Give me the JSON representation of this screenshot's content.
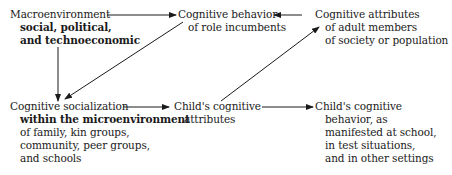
{
  "diagram": {
    "nodes": {
      "macro": {
        "lines": [
          "Macroenvironment",
          "social, political,",
          "and technoeconomic"
        ]
      },
      "role": {
        "lines": [
          "Cognitive behavior",
          "of role incumbents"
        ]
      },
      "adult": {
        "lines": [
          "Cognitive attributes",
          "of adult members",
          "of society or population"
        ]
      },
      "social": {
        "lines": [
          "Cognitive socialization",
          "within the microenvironment",
          "of family, kin groups,",
          "community, peer groups,",
          "and schools"
        ]
      },
      "childattr": {
        "lines": [
          "Child's cognitive",
          "attributes"
        ]
      },
      "childbeh": {
        "lines": [
          "Child's cognitive",
          "behavior, as",
          "manifested at school,",
          "in test situations,",
          "and in other settings"
        ]
      }
    },
    "edges": [
      {
        "from": "macro",
        "to": "role"
      },
      {
        "from": "adult",
        "to": "role"
      },
      {
        "from": "macro",
        "to": "social"
      },
      {
        "from": "role",
        "to": "social"
      },
      {
        "from": "social",
        "to": "childattr"
      },
      {
        "from": "childattr",
        "to": "adult"
      },
      {
        "from": "childattr",
        "to": "childbeh"
      }
    ],
    "colors": {
      "ink": "#1a1a1a",
      "background": "#ffffff"
    }
  }
}
